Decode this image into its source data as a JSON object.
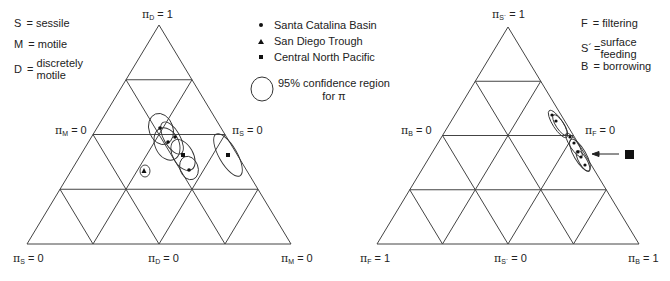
{
  "left_panel": {
    "key": [
      {
        "symbol": "S",
        "eq": "=",
        "text": [
          "sessile"
        ]
      },
      {
        "symbol": "M",
        "eq": "=",
        "text": [
          "motile"
        ]
      },
      {
        "symbol": "D",
        "eq": "=",
        "text": [
          "discretely",
          "motile"
        ]
      }
    ],
    "labels": {
      "apex": {
        "pi": "π",
        "sub": "D",
        "rest": " = 1"
      },
      "left_mid": {
        "pi": "π",
        "sub": "M",
        "rest": " = 0"
      },
      "right_mid": {
        "pi": "π",
        "sub": "S",
        "rest": " = 0"
      },
      "bottom_left": {
        "pi": "π",
        "sub": "S",
        "rest": " = 0"
      },
      "bottom_mid": {
        "pi": "π",
        "sub": "D",
        "rest": " = 0"
      },
      "bottom_right": {
        "pi": "π",
        "sub": "M",
        "rest": " = 0"
      }
    },
    "legend": [
      {
        "marker": "circle",
        "label": "Santa Catalina Basin"
      },
      {
        "marker": "triangle",
        "label": "San Diego Trough"
      },
      {
        "marker": "square",
        "label": "Central North Pacific"
      }
    ],
    "confidence_label": [
      "95% confidence region",
      "for π"
    ]
  },
  "right_panel": {
    "key": [
      {
        "symbol": "F",
        "eq": "=",
        "text": [
          "filtering"
        ]
      },
      {
        "symbol": "S´",
        "eq": "=",
        "text": [
          "surface",
          "feeding"
        ]
      },
      {
        "symbol": "B",
        "eq": "=",
        "text": [
          "borrowing"
        ]
      }
    ],
    "labels": {
      "apex": {
        "pi": "π",
        "sub": "S´",
        "rest": " = 1"
      },
      "left_mid": {
        "pi": "π",
        "sub": "B",
        "rest": " = 0"
      },
      "right_mid": {
        "pi": "π",
        "sub": "F",
        "rest": " = 0"
      },
      "bottom_left": {
        "pi": "π",
        "sub": "F",
        "rest": " = 1"
      },
      "bottom_mid": {
        "pi": "π",
        "sub": "S´",
        "rest": " = 0"
      },
      "bottom_right": {
        "pi": "π",
        "sub": "B",
        "rest": " = 1"
      }
    }
  },
  "colors": {
    "line": "#444444",
    "marker": "#111111",
    "text": "#222222"
  },
  "chart_data": [
    {
      "type": "scatter",
      "subtype": "ternary",
      "title": "Mobility (sessile / motile / discretely motile)",
      "axes": [
        "π_S",
        "π_M",
        "π_D"
      ],
      "grid_divisions": 4,
      "series": [
        {
          "name": "Santa Catalina Basin",
          "marker": "circle",
          "points_px": [
            [
              160,
              128
            ],
            [
              175,
              137
            ],
            [
              168,
              142
            ],
            [
              189,
              170
            ]
          ]
        },
        {
          "name": "San Diego Trough",
          "marker": "triangle",
          "points_px": [
            [
              144,
              171
            ]
          ]
        },
        {
          "name": "Central North Pacific",
          "marker": "square",
          "points_px": [
            [
              183,
              155
            ],
            [
              228,
              155
            ]
          ]
        }
      ],
      "annotation": "ellipses = 95% confidence region for π"
    },
    {
      "type": "scatter",
      "subtype": "ternary",
      "title": "Feeding (filtering / surface feeding / borrowing)",
      "axes": [
        "π_F",
        "π_S´",
        "π_B"
      ],
      "grid_divisions": 4,
      "series": [
        {
          "name": "Santa Catalina Basin",
          "marker": "circle",
          "points_px": [
            [
              552,
              115
            ],
            [
              556,
              121
            ],
            [
              570,
              137
            ],
            [
              574,
              143
            ],
            [
              578,
              152
            ],
            [
              581,
              157
            ],
            [
              585,
              165
            ]
          ]
        },
        {
          "name": "Central North Pacific",
          "marker": "square",
          "note": "off-chart, indicated by arrow",
          "points_px": [
            [
              630,
              154
            ]
          ]
        }
      ]
    }
  ]
}
